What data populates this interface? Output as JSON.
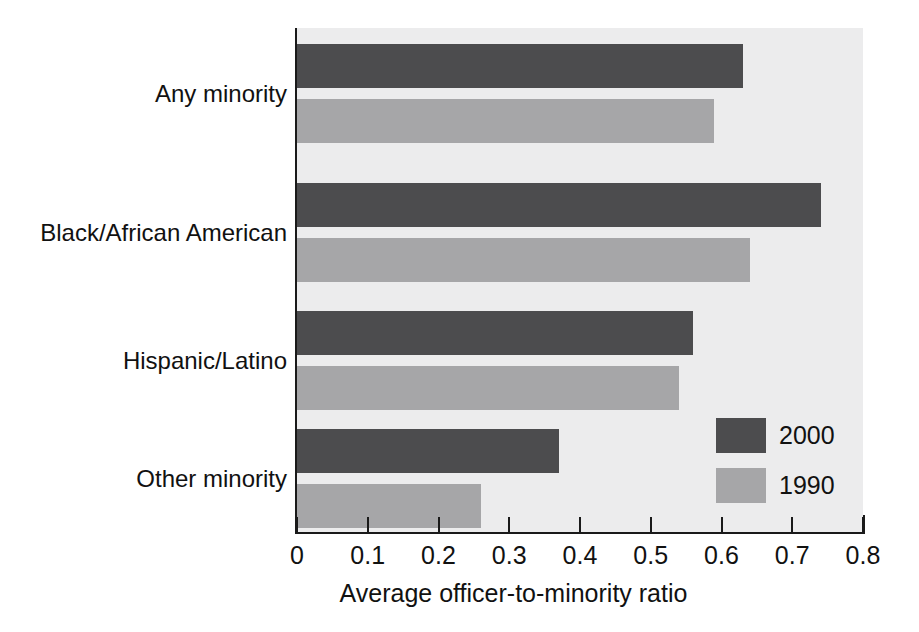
{
  "chart_data": {
    "type": "bar",
    "orientation": "horizontal",
    "title": "",
    "subtitle": "",
    "xlabel": "Average officer-to-minority ratio",
    "ylabel": "",
    "categories": [
      "Any minority",
      "Black/African American",
      "Hispanic/Latino",
      "Other minority"
    ],
    "series": [
      {
        "name": "2000",
        "color": "#4c4c4e",
        "values": [
          0.63,
          0.74,
          0.56,
          0.37
        ]
      },
      {
        "name": "1990",
        "color": "#a6a6a8",
        "values": [
          0.59,
          0.64,
          0.54,
          0.26
        ]
      }
    ],
    "xlim": [
      0,
      0.8
    ],
    "xticks": [
      0,
      0.1,
      0.2,
      0.3,
      0.4,
      0.5,
      0.6,
      0.7,
      0.8
    ],
    "xtick_labels": [
      "0",
      "0.1",
      "0.2",
      "0.3",
      "0.4",
      "0.5",
      "0.6",
      "0.7",
      "0.8"
    ],
    "grid": false,
    "legend_position": "inside-lower-right",
    "plot_background": "#ececed",
    "axis_color": "#1a1a1a"
  },
  "legend": {
    "entries": [
      {
        "label": "2000",
        "color": "#4c4c4e"
      },
      {
        "label": "1990",
        "color": "#a6a6a8"
      }
    ]
  },
  "axis": {
    "x_title": "Average officer-to-minority ratio",
    "ticks": [
      "0",
      "0.1",
      "0.2",
      "0.3",
      "0.4",
      "0.5",
      "0.6",
      "0.7",
      "0.8"
    ]
  },
  "categories": [
    "Any minority",
    "Black/African American",
    "Hispanic/Latino",
    "Other minority"
  ]
}
